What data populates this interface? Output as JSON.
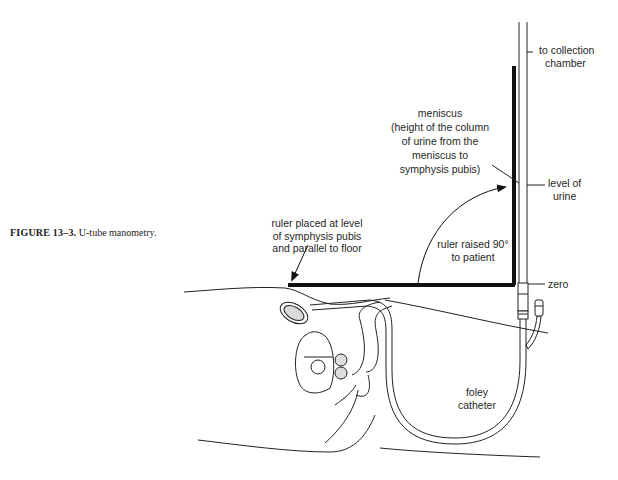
{
  "caption": {
    "figure_number": "FIGURE 13–3.",
    "title": "U-tube manometry."
  },
  "labels": {
    "collection": [
      "to collection",
      "chamber"
    ],
    "meniscus": [
      "meniscus",
      "(height of the column",
      "of urine from the",
      "meniscus to",
      "symphysis pubis)"
    ],
    "level": [
      "level of",
      "urine"
    ],
    "ruler_placed": [
      "ruler placed at level",
      "of symphysis pubis",
      "and parallel to floor"
    ],
    "ruler_raised": [
      "ruler raised 90°",
      "to patient"
    ],
    "zero": "zero",
    "foley": [
      "foley",
      "catheter"
    ]
  }
}
